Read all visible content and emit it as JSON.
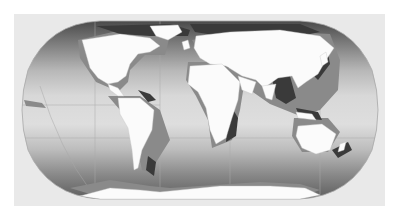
{
  "figure": {
    "caption_fragment": "",
    "projection": "robinson-like",
    "colors": {
      "background": "#ffffff",
      "panel": "#e9e9e9",
      "land": "#fbfbfb",
      "ocean_equator": "#dcdcdc",
      "ocean_pole": "#6e6e6e",
      "shelf_mid": "#8a8a8a",
      "shelf_dark": "#3a3a3a",
      "grid": "#b5b5b5",
      "outline": "#aaaaaa"
    },
    "regions": [
      {
        "name": "north-america"
      },
      {
        "name": "south-america"
      },
      {
        "name": "europe-asia"
      },
      {
        "name": "africa"
      },
      {
        "name": "australia"
      },
      {
        "name": "antarctica"
      },
      {
        "name": "greenland"
      }
    ]
  }
}
